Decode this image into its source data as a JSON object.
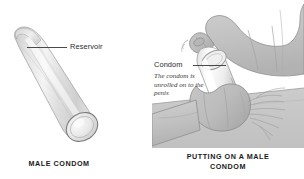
{
  "figure": {
    "background_color": "#ffffff",
    "ink_color": "#2b2b2b",
    "illustration_fill": "#d8d8d8",
    "illustration_stroke": "#8c8c8c",
    "highlight_color": "#ffffff"
  },
  "left_panel": {
    "name": "male-condom-diagram",
    "caption": "MALE CONDOM",
    "labels": [
      {
        "text": "Reservoir"
      }
    ]
  },
  "right_panel": {
    "name": "putting-on-a-male-condom-diagram",
    "caption_line_1": "PUTTING ON A MALE",
    "caption_line_2": "CONDOM",
    "labels": [
      {
        "text": "Condom"
      }
    ],
    "note": "The condom is unrolled on to the penis"
  }
}
